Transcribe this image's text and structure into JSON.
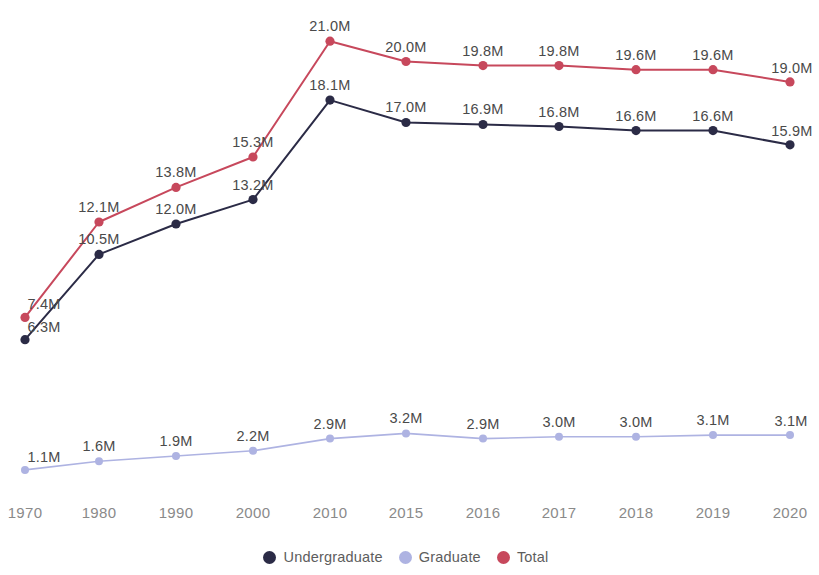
{
  "chart_data": {
    "type": "line",
    "title": "",
    "subtitle": "",
    "xlabel": "",
    "ylabel": "",
    "grid": false,
    "legend_position": "bottom-center",
    "value_suffix": "M",
    "categories": [
      "1970",
      "1980",
      "1990",
      "2000",
      "2010",
      "2015",
      "2016",
      "2017",
      "2018",
      "2019",
      "2020"
    ],
    "series": [
      {
        "name": "Undergraduate",
        "color": "#2b2b46",
        "panel": "upper",
        "values": [
          6.3,
          10.5,
          12.0,
          13.2,
          18.1,
          17.0,
          16.9,
          16.8,
          16.6,
          16.6,
          15.9
        ],
        "labels": [
          "6.3M",
          "10.5M",
          "12.0M",
          "13.2M",
          "18.1M",
          "17.0M",
          "16.9M",
          "16.8M",
          "16.6M",
          "16.6M",
          "15.9M"
        ]
      },
      {
        "name": "Graduate",
        "color": "#aeb3e2",
        "panel": "lower",
        "values": [
          1.1,
          1.6,
          1.9,
          2.2,
          2.9,
          3.2,
          2.9,
          3.0,
          3.0,
          3.1,
          3.1
        ],
        "labels": [
          "1.1M",
          "1.6M",
          "1.9M",
          "2.2M",
          "2.9M",
          "3.2M",
          "2.9M",
          "3.0M",
          "3.0M",
          "3.1M",
          "3.1M"
        ]
      },
      {
        "name": "Total",
        "color": "#c7485c",
        "panel": "upper",
        "values": [
          7.4,
          12.1,
          13.8,
          15.3,
          21.0,
          20.0,
          19.8,
          19.8,
          19.6,
          19.6,
          19.0
        ],
        "labels": [
          "7.4M",
          "12.1M",
          "13.8M",
          "15.3M",
          "21.0M",
          "20.0M",
          "19.8M",
          "19.8M",
          "19.6M",
          "19.6M",
          "19.0M"
        ]
      }
    ],
    "upper_panel": {
      "ylim": [
        5.4,
        21.8
      ],
      "pixel_top": 25,
      "pixel_bottom": 358
    },
    "lower_panel": {
      "ylim": [
        0.75,
        3.45
      ],
      "pixel_top": 429,
      "pixel_bottom": 476
    },
    "x_pixels": [
      25,
      99,
      176,
      253,
      330,
      406,
      483,
      559,
      636,
      713,
      790
    ]
  },
  "axis": {
    "x_ticks": [
      "1970",
      "1980",
      "1990",
      "2000",
      "2010",
      "2015",
      "2016",
      "2017",
      "2018",
      "2019",
      "2020"
    ]
  },
  "legend": {
    "items": [
      {
        "label": "Undergraduate",
        "color": "#2b2b46"
      },
      {
        "label": "Graduate",
        "color": "#aeb3e2"
      },
      {
        "label": "Total",
        "color": "#c7485c"
      }
    ]
  }
}
